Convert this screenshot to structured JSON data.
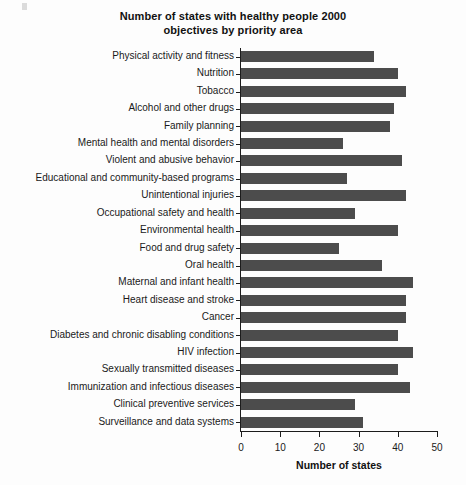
{
  "chart_data": {
    "type": "bar",
    "orientation": "horizontal",
    "title": "Number of states with healthy people 2000 objectives by priority area",
    "title_lines": [
      "Number of states with healthy people 2000",
      "objectives by priority area"
    ],
    "xlabel": "Number of states",
    "ylabel": "",
    "xlim": [
      0,
      50
    ],
    "xticks": [
      0,
      10,
      20,
      30,
      40,
      50
    ],
    "xtick_labels": [
      "0",
      "10",
      "20",
      "30",
      "40",
      "50"
    ],
    "grid": false,
    "legend": null,
    "bar_color": "#4c4c4c",
    "axis_color": "#1c1c1c",
    "background_color": "#fdfdfd",
    "categories": [
      "Physical activity and fitness",
      "Nutrition",
      "Tobacco",
      "Alcohol and other drugs",
      "Family planning",
      "Mental health and mental disorders",
      "Violent and abusive behavior",
      "Educational and community-based programs",
      "Unintentional injuries",
      "Occupational safety and health",
      "Environmental health",
      "Food and drug safety",
      "Oral health",
      "Maternal and infant health",
      "Heart disease and stroke",
      "Cancer",
      "Diabetes and chronic disabling conditions",
      "HIV infection",
      "Sexually transmitted diseases",
      "Immunization and infectious diseases",
      "Clinical preventive services",
      "Surveillance and data systems"
    ],
    "values": [
      34,
      40,
      42,
      39,
      38,
      26,
      41,
      27,
      42,
      29,
      40,
      25,
      36,
      44,
      42,
      42,
      40,
      44,
      40,
      43,
      29,
      31
    ]
  }
}
